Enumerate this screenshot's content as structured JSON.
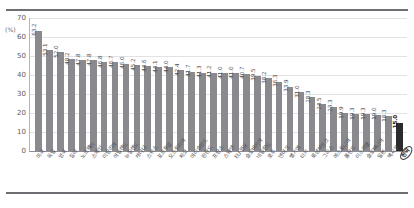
{
  "chart_data": {
    "type": "bar",
    "title": "",
    "subtitle": "",
    "xlabel": "",
    "ylabel": "",
    "yunit": "(%)",
    "ylim": [
      0,
      70
    ],
    "yticks": [
      0,
      10,
      20,
      30,
      40,
      50,
      60,
      70
    ],
    "grid": true,
    "legend": null,
    "orientation": "vertical",
    "sorted": "descending",
    "bar_color": "#8a8a8e",
    "highlight_color": "#2b2b2e",
    "highlight_index": 33,
    "categories": [
      "미국",
      "독일",
      "영국",
      "칠레",
      "노르웨이",
      "스페인",
      "이탈리아",
      "아일랜드",
      "뉴질랜드",
      "캐나다",
      "스위스",
      "포르투갈",
      "오스트리아",
      "체코",
      "아이슬란드",
      "핀란드",
      "프랑스",
      "스웨덴",
      "EU 평균",
      "슬로바키아",
      "네덜란드",
      "호주",
      "덴마크",
      "벨기에",
      "터키",
      "룩셈부르크",
      "그리스",
      "에스토니아",
      "폴란드",
      "이스라엘",
      "슬로베니아",
      "일본",
      "멕시코",
      "한국"
    ],
    "categories_note": "Korean country names; final category is circled/highlighted",
    "values": [
      63.2,
      53.1,
      52.0,
      48.2,
      47.8,
      47.8,
      46.8,
      46.7,
      46.0,
      45.2,
      44.6,
      44.1,
      44.0,
      42.4,
      41.7,
      41.3,
      41.2,
      41.0,
      41.0,
      40.7,
      39.5,
      38.2,
      36.3,
      33.9,
      31.0,
      28.3,
      24.5,
      23.3,
      19.9,
      19.3,
      19.3,
      19.0,
      18.3,
      15.0
    ],
    "value_labels": [
      "63.2",
      "53.1",
      "52.0",
      "48.2",
      "47.8",
      "47.8",
      "46.8",
      "46.7",
      "46.0",
      "45.2",
      "44.6",
      "44.1",
      "44.0",
      "42.4",
      "41.7",
      "41.3",
      "41.2",
      "41.0",
      "41.0",
      "40.7",
      "39.5",
      "38.2",
      "36.3",
      "33.9",
      "31.0",
      "28.3",
      "24.5",
      "23.3",
      "19.9",
      "19.3",
      "19.3",
      "19.0",
      "18.3",
      "15.0"
    ]
  }
}
